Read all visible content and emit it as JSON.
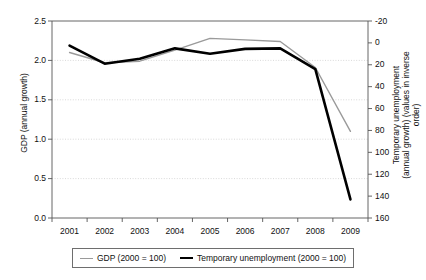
{
  "chart_data": {
    "type": "line",
    "title": "",
    "xlabel": "",
    "categories": [
      "2001",
      "2002",
      "2003",
      "2004",
      "2005",
      "2006",
      "2007",
      "2008",
      "2009"
    ],
    "x": [
      2001,
      2002,
      2003,
      2004,
      2005,
      2006,
      2007,
      2008,
      2009
    ],
    "grid": true,
    "legend_position": "bottom",
    "left_axis": {
      "label": "GDP (annual growth)",
      "ticks": [
        "0.0",
        "0.5",
        "1.0",
        "1.5",
        "2.0",
        "2.5"
      ],
      "tick_values": [
        0.0,
        0.5,
        1.0,
        1.5,
        2.0,
        2.5
      ],
      "ylim": [
        0.0,
        2.5
      ],
      "inverted": false
    },
    "right_axis": {
      "label_line1": "Temporary unemployment",
      "label_line2": "(annual growth) (values in inverse order)",
      "ticks": [
        "-20",
        "0",
        "20",
        "40",
        "60",
        "80",
        "100",
        "120",
        "140",
        "160"
      ],
      "tick_values": [
        -20,
        0,
        20,
        40,
        60,
        80,
        100,
        120,
        140,
        160
      ],
      "ylim": [
        -20,
        160
      ],
      "inverted": true
    },
    "series": [
      {
        "name": "GDP (2000 = 100)",
        "axis": "left",
        "color": "#9a9a9a",
        "width": 1.4,
        "values": [
          2.1,
          1.97,
          1.99,
          2.13,
          2.28,
          2.26,
          2.24,
          1.91,
          1.1
        ]
      },
      {
        "name": "Temporary unemployment (2000 = 100)",
        "axis": "right",
        "color": "#000000",
        "width": 2.6,
        "values": [
          2.5,
          19.0,
          14.5,
          5.0,
          10.0,
          5.5,
          5.0,
          24.0,
          143.0
        ],
        "values_on_left_scale": [
          1.94,
          2.0,
          2.07,
          2.3,
          2.22,
          2.3,
          2.3,
          2.0,
          0.2
        ]
      }
    ]
  },
  "legend": {
    "items": [
      {
        "label": "GDP (2000 = 100)",
        "swatch": "gdp-line-swatch"
      },
      {
        "label": "Temporary unemployment (2000 = 100)",
        "swatch": "unemployment-line-swatch"
      }
    ]
  }
}
